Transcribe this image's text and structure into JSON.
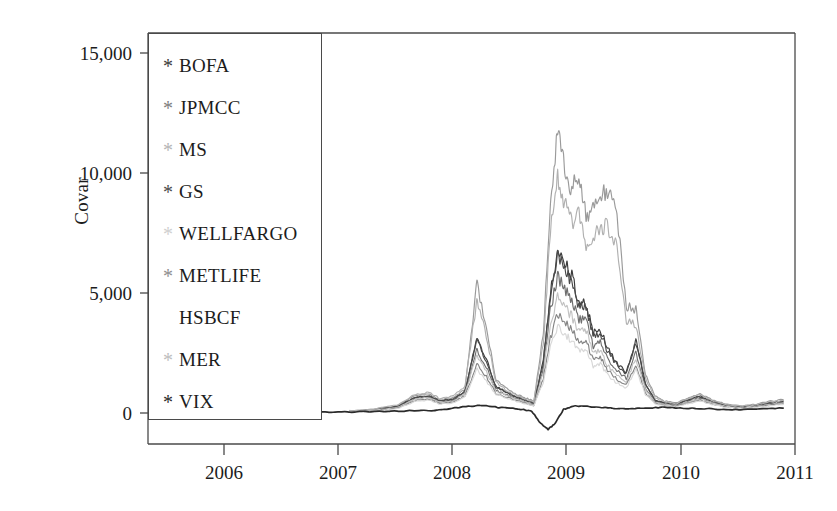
{
  "chart_data": {
    "type": "line",
    "title": "",
    "xlabel": "",
    "ylabel": "Covar",
    "xlim": [
      2005.55,
      2011.0
    ],
    "ylim": [
      -800,
      16000
    ],
    "grid": false,
    "legend_position": "upper-left-inside",
    "xtick_labels": [
      "2006",
      "2007",
      "2008",
      "2009",
      "2010",
      "2011"
    ],
    "xtick_values": [
      2006,
      2007,
      2008,
      2009,
      2010,
      2011
    ],
    "ytick_labels": [
      "0",
      "5,000",
      "10,000",
      "15,000"
    ],
    "ytick_values": [
      0,
      5000,
      10000,
      15000
    ],
    "series": [
      {
        "name": "BOFA",
        "color": "#3b3b3b",
        "marker": "*",
        "x": [
          2007.25,
          2007.45,
          2007.65,
          2007.8,
          2007.92,
          2008.0,
          2008.12,
          2008.22,
          2008.32,
          2008.4,
          2008.48,
          2008.56,
          2008.64,
          2008.72,
          2008.8,
          2008.88,
          2008.94,
          2009.0,
          2009.06,
          2009.12,
          2009.18,
          2009.24,
          2009.3,
          2009.36,
          2009.42,
          2009.5,
          2009.58,
          2009.66,
          2009.74,
          2009.82,
          2009.9,
          2010.0,
          2010.1,
          2010.2,
          2010.3,
          2010.42,
          2010.54,
          2010.66,
          2010.78,
          2010.9
        ],
        "y": [
          60,
          120,
          260,
          640,
          700,
          500,
          560,
          900,
          3150,
          2250,
          1100,
          900,
          700,
          560,
          420,
          2200,
          5050,
          6800,
          6300,
          5700,
          4600,
          4600,
          3350,
          3500,
          2700,
          2050,
          1700,
          3050,
          1250,
          560,
          420,
          380,
          560,
          700,
          500,
          320,
          260,
          320,
          420,
          500
        ]
      },
      {
        "name": "JPMCC",
        "color": "#6f6f6f",
        "marker": "*",
        "x": [
          2007.25,
          2007.45,
          2007.65,
          2007.8,
          2007.92,
          2008.0,
          2008.12,
          2008.22,
          2008.32,
          2008.4,
          2008.48,
          2008.56,
          2008.64,
          2008.72,
          2008.8,
          2008.88,
          2008.94,
          2009.0,
          2009.06,
          2009.12,
          2009.18,
          2009.24,
          2009.3,
          2009.36,
          2009.42,
          2009.5,
          2009.58,
          2009.66,
          2009.74,
          2009.82,
          2009.9,
          2010.0,
          2010.1,
          2010.2,
          2010.3,
          2010.42,
          2010.54,
          2010.66,
          2010.78,
          2010.9
        ],
        "y": [
          60,
          100,
          240,
          600,
          660,
          460,
          520,
          820,
          2600,
          1900,
          950,
          780,
          620,
          480,
          360,
          1900,
          4300,
          5700,
          5200,
          4700,
          3900,
          3900,
          2800,
          2950,
          2250,
          1750,
          1450,
          2550,
          1050,
          480,
          360,
          320,
          480,
          620,
          430,
          280,
          230,
          280,
          360,
          430
        ]
      },
      {
        "name": "MS",
        "color": "#9a9a9a",
        "marker": "*",
        "x": [
          2007.25,
          2007.45,
          2007.65,
          2007.8,
          2007.92,
          2008.0,
          2008.12,
          2008.22,
          2008.32,
          2008.4,
          2008.48,
          2008.56,
          2008.64,
          2008.72,
          2008.8,
          2008.88,
          2008.94,
          2009.0,
          2009.06,
          2009.12,
          2009.18,
          2009.24,
          2009.3,
          2009.36,
          2009.42,
          2009.5,
          2009.58,
          2009.66,
          2009.74,
          2009.82,
          2009.9,
          2010.0,
          2010.1,
          2010.2,
          2010.3,
          2010.42,
          2010.54,
          2010.66,
          2010.78,
          2010.9
        ],
        "y": [
          80,
          150,
          300,
          720,
          800,
          560,
          640,
          1000,
          5400,
          3600,
          1400,
          1050,
          800,
          640,
          500,
          3300,
          8800,
          11850,
          10200,
          9300,
          9900,
          8200,
          8600,
          9100,
          9200,
          8300,
          4500,
          4300,
          1600,
          700,
          500,
          420,
          640,
          800,
          560,
          360,
          300,
          360,
          480,
          560
        ]
      },
      {
        "name": "GS",
        "color": "#4a4a4a",
        "marker": "*",
        "x": [
          2007.25,
          2007.45,
          2007.65,
          2007.8,
          2007.92,
          2008.0,
          2008.12,
          2008.22,
          2008.32,
          2008.4,
          2008.48,
          2008.56,
          2008.64,
          2008.72,
          2008.8,
          2008.88,
          2008.94,
          2009.0,
          2009.06,
          2009.12,
          2009.18,
          2009.24,
          2009.3,
          2009.36,
          2009.42,
          2009.5,
          2009.58,
          2009.66,
          2009.74,
          2009.82,
          2009.9,
          2010.0,
          2010.1,
          2010.2,
          2010.3,
          2010.42,
          2010.54,
          2010.66,
          2010.78,
          2010.9
        ],
        "y": [
          70,
          130,
          270,
          660,
          730,
          520,
          580,
          930,
          3050,
          2150,
          1080,
          880,
          690,
          540,
          410,
          2100,
          4900,
          6500,
          6000,
          5450,
          4400,
          4450,
          3200,
          3350,
          2600,
          1980,
          1650,
          2950,
          1200,
          540,
          410,
          370,
          540,
          680,
          490,
          310,
          250,
          310,
          410,
          490
        ]
      },
      {
        "name": "WELLFARGO",
        "color": "#c2c2c2",
        "marker": "*",
        "x": [
          2007.25,
          2007.45,
          2007.65,
          2007.8,
          2007.92,
          2008.0,
          2008.12,
          2008.22,
          2008.32,
          2008.4,
          2008.48,
          2008.56,
          2008.64,
          2008.72,
          2008.8,
          2008.88,
          2008.94,
          2009.0,
          2009.06,
          2009.12,
          2009.18,
          2009.24,
          2009.3,
          2009.36,
          2009.42,
          2009.5,
          2009.58,
          2009.66,
          2009.74,
          2009.82,
          2009.9,
          2010.0,
          2010.1,
          2010.2,
          2010.3,
          2010.42,
          2010.54,
          2010.66,
          2010.78,
          2010.9
        ],
        "y": [
          60,
          110,
          230,
          580,
          640,
          450,
          500,
          800,
          2400,
          1750,
          900,
          740,
          590,
          460,
          350,
          1700,
          3700,
          4900,
          4450,
          4000,
          3400,
          3450,
          2500,
          2600,
          2000,
          1550,
          1300,
          2300,
          950,
          460,
          350,
          300,
          460,
          590,
          410,
          270,
          220,
          270,
          350,
          410
        ]
      },
      {
        "name": "METLIFE",
        "color": "#858585",
        "marker": "*",
        "x": [
          2007.25,
          2007.45,
          2007.65,
          2007.8,
          2007.92,
          2008.0,
          2008.12,
          2008.22,
          2008.32,
          2008.4,
          2008.48,
          2008.56,
          2008.64,
          2008.72,
          2008.8,
          2008.88,
          2008.94,
          2009.0,
          2009.06,
          2009.12,
          2009.18,
          2009.24,
          2009.3,
          2009.36,
          2009.42,
          2009.5,
          2009.58,
          2009.66,
          2009.74,
          2009.82,
          2009.9,
          2010.0,
          2010.1,
          2010.2,
          2010.3,
          2010.42,
          2010.54,
          2010.66,
          2010.78,
          2010.9
        ],
        "y": [
          50,
          90,
          200,
          520,
          580,
          400,
          450,
          720,
          2000,
          1500,
          820,
          680,
          540,
          420,
          320,
          1450,
          3100,
          4150,
          3800,
          3450,
          2950,
          3000,
          2200,
          2300,
          1800,
          1400,
          1180,
          2000,
          850,
          420,
          320,
          280,
          420,
          540,
          380,
          250,
          200,
          250,
          320,
          380
        ]
      },
      {
        "name": "HSBCF",
        "color": "#d8d8d8",
        "marker": "",
        "x": [
          2007.25,
          2007.45,
          2007.65,
          2007.8,
          2007.92,
          2008.0,
          2008.12,
          2008.22,
          2008.32,
          2008.4,
          2008.48,
          2008.56,
          2008.64,
          2008.72,
          2008.8,
          2008.88,
          2008.94,
          2009.0,
          2009.06,
          2009.12,
          2009.18,
          2009.24,
          2009.3,
          2009.36,
          2009.42,
          2009.5,
          2009.58,
          2009.66,
          2009.74,
          2009.82,
          2009.9,
          2010.0,
          2010.1,
          2010.2,
          2010.3,
          2010.42,
          2010.54,
          2010.66,
          2010.78,
          2010.9
        ],
        "y": [
          45,
          85,
          180,
          480,
          540,
          370,
          420,
          670,
          1800,
          1350,
          760,
          630,
          500,
          390,
          300,
          1300,
          2700,
          3600,
          3300,
          3000,
          2600,
          2650,
          1950,
          2050,
          1600,
          1250,
          1050,
          1800,
          780,
          390,
          300,
          260,
          390,
          500,
          350,
          230,
          185,
          230,
          300,
          350
        ]
      },
      {
        "name": "MER",
        "color": "#b0b0b0",
        "marker": "*",
        "x": [
          2007.25,
          2007.45,
          2007.65,
          2007.8,
          2007.92,
          2008.0,
          2008.12,
          2008.22,
          2008.32,
          2008.4,
          2008.48,
          2008.56,
          2008.64,
          2008.72,
          2008.8,
          2008.88,
          2008.94,
          2009.0,
          2009.06,
          2009.12,
          2009.18,
          2009.24,
          2009.3,
          2009.36,
          2009.42,
          2009.5,
          2009.58,
          2009.66,
          2009.74,
          2009.82,
          2009.9,
          2010.0,
          2010.1,
          2010.2,
          2010.3,
          2010.42,
          2010.54,
          2010.66,
          2010.78,
          2010.9
        ],
        "y": [
          90,
          170,
          340,
          780,
          860,
          610,
          700,
          1100,
          4700,
          3200,
          1300,
          980,
          760,
          600,
          470,
          2900,
          7600,
          9900,
          8700,
          7900,
          8300,
          7000,
          7300,
          7700,
          7800,
          7000,
          3900,
          3700,
          1450,
          650,
          470,
          400,
          600,
          760,
          520,
          340,
          280,
          340,
          450,
          520
        ]
      },
      {
        "name": "VIX",
        "color": "#2a2a2a",
        "marker": "*",
        "x": [
          2005.62,
          2006.0,
          2006.5,
          2007.0,
          2007.25,
          2007.5,
          2007.75,
          2008.0,
          2008.2,
          2008.35,
          2008.5,
          2008.65,
          2008.78,
          2008.86,
          2008.92,
          2008.98,
          2009.05,
          2009.15,
          2009.3,
          2009.45,
          2009.6,
          2009.75,
          2009.9,
          2010.1,
          2010.3,
          2010.5,
          2010.7,
          2010.9
        ],
        "y": [
          10,
          15,
          20,
          30,
          45,
          60,
          90,
          120,
          260,
          330,
          230,
          180,
          90,
          -450,
          -700,
          -420,
          150,
          300,
          260,
          200,
          180,
          210,
          240,
          200,
          170,
          140,
          170,
          200
        ]
      }
    ]
  },
  "axes": {
    "ylabel": "Covar",
    "yticks": [
      "15,000",
      "10,000",
      "5,000",
      "0"
    ],
    "xticks": [
      "2006",
      "2007",
      "2008",
      "2009",
      "2010",
      "2011"
    ]
  },
  "legend": {
    "items": [
      {
        "marker": "*",
        "label": "BOFA",
        "color": "#3b3b3b"
      },
      {
        "marker": "*",
        "label": "JPMCC",
        "color": "#7d7d7d"
      },
      {
        "marker": "*",
        "label": "MS",
        "color": "#b5b5b5"
      },
      {
        "marker": "*",
        "label": "GS",
        "color": "#4a4a4a"
      },
      {
        "marker": "*",
        "label": "WELLFARGO",
        "color": "#cfcfcf"
      },
      {
        "marker": "*",
        "label": "METLIFE",
        "color": "#8e8e8e"
      },
      {
        "marker": "",
        "label": "HSBCF",
        "color": "#e2e2e2"
      },
      {
        "marker": "*",
        "label": "MER",
        "color": "#bdbdbd"
      },
      {
        "marker": "*",
        "label": "VIX",
        "color": "#2a2a2a"
      }
    ]
  }
}
